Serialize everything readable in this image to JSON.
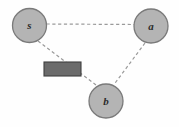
{
  "figure": {
    "width": 179,
    "height": 127,
    "background_color": "#fefefe"
  },
  "colors": {
    "node_fill": "#b4b4b4",
    "node_stroke": "#7a7a7a",
    "edge_stroke": "#9a9a9a",
    "obstacle_fill": "#6b6b6b",
    "obstacle_stroke": "#3f3f3f",
    "label_color": "#2b2b2b"
  },
  "nodes": [
    {
      "id": "s",
      "label": "s",
      "cx": 29.5,
      "cy": 25.5,
      "r": 17.0
    },
    {
      "id": "a",
      "label": "a",
      "cx": 151.0,
      "cy": 26.0,
      "r": 17.0
    },
    {
      "id": "b",
      "label": "b",
      "cx": 106.0,
      "cy": 101.0,
      "r": 17.0
    }
  ],
  "edges": [
    {
      "id": "s-a",
      "from": "s",
      "to": "a",
      "style": "dashed",
      "x1": 46.5,
      "y1": 24.0,
      "x2": 134.0,
      "y2": 24.5
    },
    {
      "id": "a-b",
      "from": "a",
      "to": "b",
      "style": "dashed",
      "x1": 145.0,
      "y1": 43.0,
      "x2": 114.0,
      "y2": 84.5
    },
    {
      "id": "s-b",
      "from": "s",
      "to": "b",
      "style": "dashed",
      "x1": 38.0,
      "y1": 41.0,
      "x2": 96.0,
      "y2": 85.0
    }
  ],
  "obstacle": {
    "id": "obstacle-rect",
    "x": 44.0,
    "y": 62.0,
    "width": 37.0,
    "height": 14.0
  }
}
